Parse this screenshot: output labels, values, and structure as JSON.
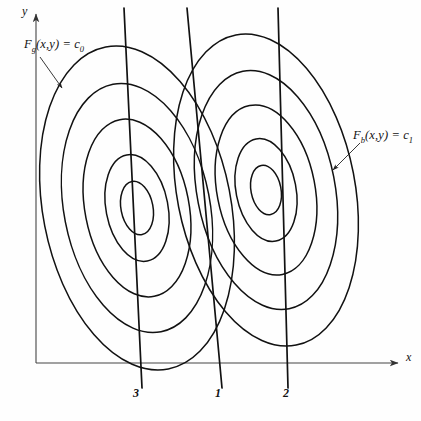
{
  "figure": {
    "kind": "contour-diagram",
    "background": "#fefefe",
    "stroke": "#111111",
    "axis_color": "#444444"
  },
  "axes": {
    "x_label": "x",
    "y_label": "y",
    "x_axis": {
      "x1": 36,
      "y1": 363,
      "x2": 398,
      "y2": 363
    },
    "y_axis": {
      "x1": 36,
      "y1": 363,
      "x2": 36,
      "y2": 14
    }
  },
  "labels": {
    "left_family": {
      "base": "F",
      "sub": "g",
      "args": "(x,y)",
      "rel": "=",
      "rhs_base": "c",
      "rhs_sub": "0",
      "text": "F (x,y) = c"
    },
    "right_family": {
      "base": "F",
      "sub": "b",
      "args": "(x,y)",
      "rel": "=",
      "rhs_base": "c",
      "rhs_sub": "1",
      "text": "F (x,y) = c"
    }
  },
  "line_labels": [
    {
      "id": "3",
      "text": "3",
      "x": 133,
      "y": 398
    },
    {
      "id": "1",
      "text": "1",
      "x": 215,
      "y": 398
    },
    {
      "id": "2",
      "text": "2",
      "x": 283,
      "y": 398
    }
  ],
  "chart_data": {
    "type": "line",
    "title": "",
    "xlabel": "x",
    "ylabel": "y",
    "grid": false,
    "legend": "none",
    "contour_families": [
      {
        "name": "F_g(x,y) = c_0",
        "center": [
          137,
          208
        ],
        "rotation_deg": -11,
        "levels": 5,
        "radii": [
          {
            "rx": 16,
            "ry": 27
          },
          {
            "rx": 31,
            "ry": 54
          },
          {
            "rx": 52,
            "ry": 90
          },
          {
            "rx": 73,
            "ry": 126
          },
          {
            "rx": 94,
            "ry": 164
          }
        ]
      },
      {
        "name": "F_b(x,y) = c_1",
        "center": [
          266,
          190
        ],
        "rotation_deg": -11,
        "levels": 5,
        "radii": [
          {
            "rx": 15,
            "ry": 25
          },
          {
            "rx": 30,
            "ry": 52
          },
          {
            "rx": 49,
            "ry": 86
          },
          {
            "rx": 69,
            "ry": 121
          },
          {
            "rx": 89,
            "ry": 158
          }
        ]
      }
    ],
    "straight_lines": [
      {
        "label": "3",
        "x1": 124,
        "y1": 8,
        "x2": 142,
        "y2": 388
      },
      {
        "label": "1",
        "x1": 187,
        "y1": 8,
        "x2": 222,
        "y2": 388
      },
      {
        "label": "2",
        "x1": 278,
        "y1": 8,
        "x2": 288,
        "y2": 388
      }
    ],
    "leaders": [
      {
        "for": "F_g(x,y) = c_0",
        "x1": 40,
        "y1": 57,
        "x2": 62,
        "y2": 88
      },
      {
        "for": "F_b(x,y) = c_1",
        "x1": 360,
        "y1": 143,
        "x2": 333,
        "y2": 170
      }
    ]
  }
}
